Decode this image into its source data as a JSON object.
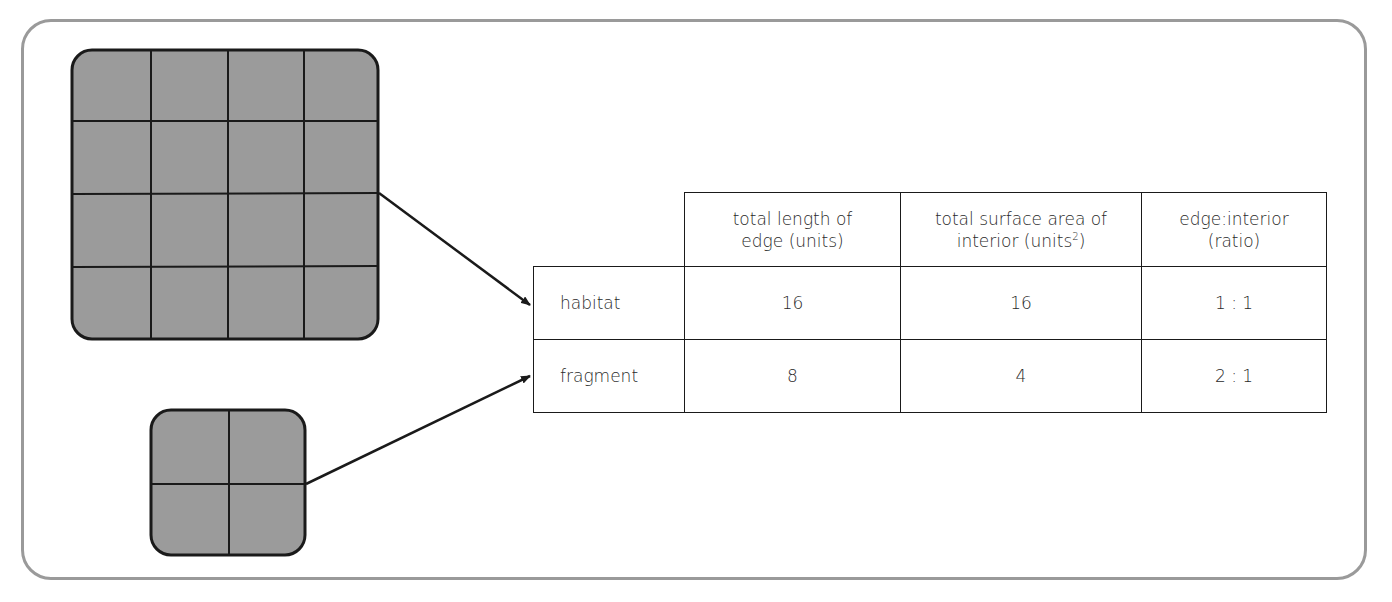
{
  "diagram": {
    "shapes": [
      {
        "name": "habitat",
        "grid": "4x4",
        "fill": "#9b9b9b",
        "cells": 16
      },
      {
        "name": "fragment",
        "grid": "2x2",
        "fill": "#9b9b9b",
        "cells": 4
      }
    ],
    "frame_color": "#9a9a9a",
    "line_color": "#1a1a1a"
  },
  "table": {
    "headers": [
      {
        "line1": "total length of",
        "line2": "edge (units)"
      },
      {
        "line1": "total surface area of",
        "line2": "interior (units",
        "sup": "2",
        "suffix": ")"
      },
      {
        "line1": "edge:interior",
        "line2": "(ratio)"
      }
    ],
    "rows": [
      {
        "label": "habitat",
        "edge": "16",
        "interior": "16",
        "ratio": "1 : 1"
      },
      {
        "label": "fragment",
        "edge": "8",
        "interior": "4",
        "ratio": "2 : 1"
      }
    ]
  }
}
